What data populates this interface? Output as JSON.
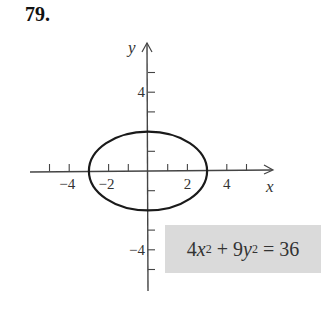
{
  "problem_number": "79.",
  "equation": {
    "text": "4x^2 + 9y^2 = 36",
    "parts": {
      "c1": "4",
      "v1": "x",
      "p1": "2",
      "plus": " + ",
      "c2": "9",
      "v2": "y",
      "p2": "2",
      "eq": " = 36"
    },
    "background": "#dadada"
  },
  "chart_data": {
    "type": "line",
    "title": "79.",
    "curve": "ellipse",
    "equation": "4x^2 + 9y^2 = 36",
    "center": [
      0,
      0
    ],
    "semi_axes": {
      "a": 3,
      "b": 2
    },
    "vertices": [
      [
        -3,
        0
      ],
      [
        3,
        0
      ],
      [
        0,
        2
      ],
      [
        0,
        -2
      ]
    ],
    "xlabel": "x",
    "ylabel": "y",
    "xlim": [
      -5.5,
      6.5
    ],
    "ylim": [
      -6,
      6.5
    ],
    "x_ticks": [
      -5,
      -4,
      -2,
      -1,
      1,
      2,
      4,
      5
    ],
    "y_ticks": [
      -5,
      -4,
      -3,
      -1,
      1,
      3,
      4,
      5
    ],
    "x_tick_labels": [
      {
        "value": -4,
        "label": "−4"
      },
      {
        "value": -2,
        "label": "−2"
      },
      {
        "value": 2,
        "label": "2"
      },
      {
        "value": 4,
        "label": "4"
      }
    ],
    "y_tick_labels": [
      {
        "value": 4,
        "label": "4"
      },
      {
        "value": -4,
        "label": "−4"
      }
    ],
    "grid": false,
    "legend": "none",
    "curve_color": "#1a1a1a",
    "axis_color": "#444444"
  }
}
